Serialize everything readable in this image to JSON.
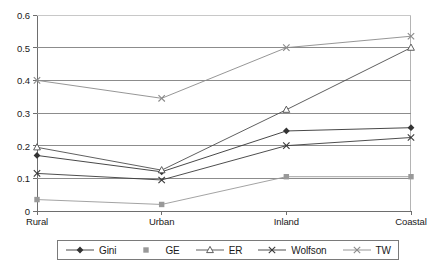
{
  "chart_data": {
    "type": "line",
    "title": "",
    "xlabel": "",
    "ylabel": "",
    "categories": [
      "Rural",
      "Urban",
      "Inland",
      "Coastal"
    ],
    "ylim": [
      0,
      0.6
    ],
    "yticks": [
      "0",
      "0.1",
      "0.2",
      "0.3",
      "0.4",
      "0.5",
      "0.6"
    ],
    "ytick_values": [
      0,
      0.1,
      0.2,
      0.3,
      0.4,
      0.5,
      0.6
    ],
    "grid": "horizontal",
    "legend_position": "bottom",
    "series": [
      {
        "name": "Gini",
        "marker": "filled-diamond",
        "color": "#333333",
        "values": [
          0.17,
          0.12,
          0.245,
          0.255
        ]
      },
      {
        "name": "GE",
        "marker": "filled-square",
        "color": "#999999",
        "values": [
          0.035,
          0.02,
          0.105,
          0.105
        ]
      },
      {
        "name": "ER",
        "marker": "open-triangle",
        "color": "#4d4d4d",
        "values": [
          0.195,
          0.125,
          0.31,
          0.5
        ]
      },
      {
        "name": "Wolfson",
        "marker": "cross-x",
        "color": "#3a3a3a",
        "values": [
          0.115,
          0.095,
          0.2,
          0.225
        ]
      },
      {
        "name": "TW",
        "marker": "cross-x-light",
        "color": "#8a8a8a",
        "values": [
          0.4,
          0.345,
          0.5,
          0.535
        ]
      }
    ]
  }
}
